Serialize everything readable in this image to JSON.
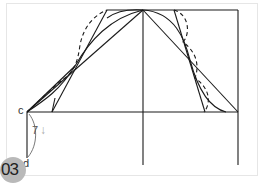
{
  "figure": {
    "step_number": "03",
    "labels": {
      "point_c": "c",
      "point_d": "d",
      "dimension": "7",
      "dimension_arrow": "↓"
    },
    "colors": {
      "line": "#1a1a1a",
      "badge": "#b9b9b9",
      "frame": "#e6e6e6"
    }
  }
}
